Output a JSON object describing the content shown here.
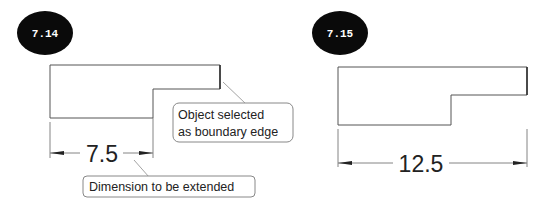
{
  "figures": [
    {
      "id": "fig-7-14",
      "badge": "7.14",
      "dimension_value": "7.5",
      "callouts": {
        "boundary_line1": "Object selected",
        "boundary_line2": "as boundary edge",
        "dimension": "Dimension to be extended"
      }
    },
    {
      "id": "fig-7-15",
      "badge": "7.15",
      "dimension_value": "12.5"
    }
  ],
  "colors": {
    "badge_fill": "#0a0a0a",
    "badge_text": "#ffffff",
    "lines": "#555555",
    "text": "#222222",
    "background": "#ffffff"
  }
}
